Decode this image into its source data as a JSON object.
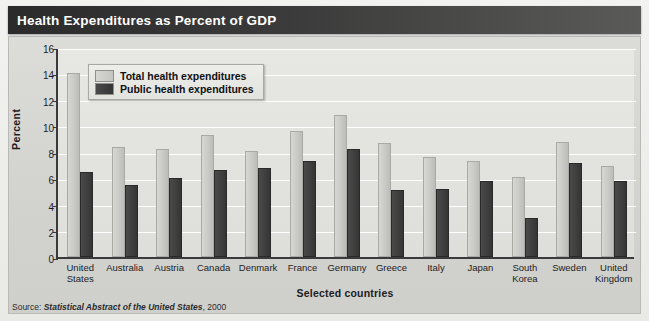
{
  "title": "Health Expenditures as Percent of GDP",
  "legend": {
    "total_label": "Total health expenditures",
    "public_label": "Public health expenditures"
  },
  "source": {
    "prefix": "Source:",
    "publication": "Statistical Abstract of the United States",
    "year": ", 2000"
  },
  "colors": {
    "banner_dark": "#2b2b2b",
    "total_bar": "#c9c9c6",
    "public_bar": "#3f3f3f",
    "plot_background": "#e2e2df",
    "axis": "#3a3a3a"
  },
  "chart_data": {
    "type": "bar",
    "title": "Health Expenditures as Percent of GDP",
    "xlabel": "Selected countries",
    "ylabel": "Percent",
    "ylim": [
      0,
      16
    ],
    "yticks": [
      0,
      2,
      4,
      6,
      8,
      10,
      12,
      14,
      16
    ],
    "grid": true,
    "legend_position": "inside-top-left",
    "categories": [
      "United States",
      "Australia",
      "Austria",
      "Canada",
      "Denmark",
      "France",
      "Germany",
      "Greece",
      "Italy",
      "Japan",
      "South Korea",
      "Sweden",
      "United Kingdom"
    ],
    "category_lines": [
      [
        "United",
        "States"
      ],
      [
        "Australia"
      ],
      [
        "Austria"
      ],
      [
        "Canada"
      ],
      [
        "Denmark"
      ],
      [
        "France"
      ],
      [
        "Germany"
      ],
      [
        "Greece"
      ],
      [
        "Italy"
      ],
      [
        "Japan"
      ],
      [
        "South",
        "Korea"
      ],
      [
        "Sweden"
      ],
      [
        "United",
        "Kingdom"
      ]
    ],
    "series": [
      {
        "name": "Total health expenditures",
        "color": "#c9c9c6",
        "values": [
          14.0,
          8.4,
          8.2,
          9.3,
          8.1,
          9.6,
          10.8,
          8.7,
          7.6,
          7.3,
          6.1,
          8.8,
          6.9
        ]
      },
      {
        "name": "Public health expenditures",
        "color": "#3f3f3f",
        "values": [
          6.5,
          5.5,
          6.0,
          6.6,
          6.8,
          7.3,
          8.2,
          5.1,
          5.2,
          5.8,
          3.0,
          7.2,
          5.8
        ]
      }
    ]
  }
}
